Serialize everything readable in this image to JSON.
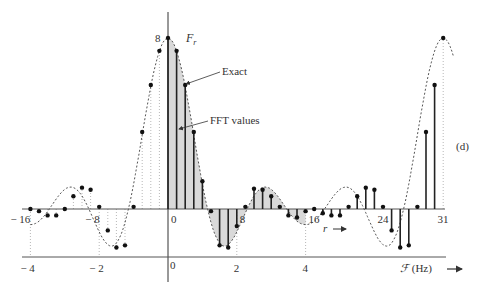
{
  "figure": {
    "panel_label": "(d)",
    "peak_label": "8",
    "function_label": "F",
    "function_subscript": "r",
    "annotation_exact": "Exact",
    "annotation_fft": "FFT  values",
    "r_axis_label": "r",
    "f_axis_label": "F (Hz)"
  },
  "chart_data": {
    "type": "line",
    "title": "",
    "xlabel": "r",
    "x2label": "F (Hz)",
    "ylabel": "F_r",
    "r_ticks": [
      -16,
      -8,
      0,
      8,
      16,
      24,
      31
    ],
    "r_tick_labels": [
      "− 16",
      "− 8",
      "0",
      "8",
      "16",
      "24",
      "31"
    ],
    "f_ticks": [
      -4,
      -2,
      0,
      2,
      4
    ],
    "f_tick_labels": [
      "− 4",
      "− 2",
      "0",
      "2",
      "4"
    ],
    "ylim": [
      -2,
      8.2
    ],
    "series": [
      {
        "name": "Exact",
        "style": "dotted",
        "description": "Continuous sinc-like spectrum centered at r=0 (repeated around r=32)"
      },
      {
        "name": "FFT values",
        "style": "stems with dots",
        "r": [
          0,
          1,
          2,
          3,
          4,
          5,
          6,
          7,
          8,
          9,
          10,
          11,
          12,
          13,
          14,
          15,
          16,
          17,
          18,
          19,
          20,
          21,
          22,
          23,
          24,
          25,
          26,
          27,
          28,
          29,
          30,
          31
        ],
        "values": [
          8,
          7.4,
          5.8,
          3.6,
          1.3,
          -0.1,
          -1.7,
          -1.8,
          -0.8,
          0.1,
          0.95,
          0.9,
          0.6,
          0.1,
          -0.3,
          -0.4,
          -0.1,
          0.0,
          -0.2,
          -0.3,
          -0.3,
          0.1,
          0.6,
          1.0,
          0.9,
          0.1,
          -1.0,
          -1.8,
          -1.7,
          0.1,
          3.6,
          5.8,
          7.4
        ]
      }
    ],
    "negative_side_points": {
      "r": [
        -16,
        -15,
        -14,
        -13,
        -12,
        -11,
        -10,
        -9,
        -8,
        -7,
        -6,
        -5,
        -4,
        -3,
        -2,
        -1
      ],
      "values": [
        0.0,
        -0.1,
        -0.3,
        -0.3,
        0.0,
        0.6,
        1.0,
        0.9,
        0.1,
        -1.0,
        -1.8,
        -1.7,
        0.1,
        3.6,
        5.8,
        7.4
      ]
    },
    "grid": false,
    "legend": "annotations with arrows"
  }
}
